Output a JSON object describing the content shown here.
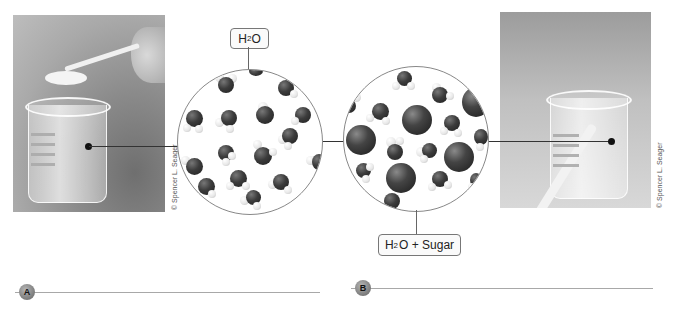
{
  "figure": {
    "panel_a": {
      "marker": "A",
      "photo": "Beaker of water with spoon of sugar being added",
      "photo_credit": "© Spencer L. Seager",
      "label": {
        "main": "H",
        "sub": "2",
        "tail": "O"
      }
    },
    "panel_b": {
      "marker": "B",
      "photo": "Beaker of sugar solution with stirring rod",
      "photo_credit": "© Spencer L. Seager",
      "label": {
        "main": "H",
        "sub": "2",
        "tail": "O + Sugar"
      }
    },
    "molecules": {
      "water_circle": "Water molecules (dark oxygen, white hydrogens)",
      "solution_circle": "Water molecules mixed with large dark sugar molecules"
    },
    "colors": {
      "oxygen": "#2e2e2e",
      "hydrogen": "#eeeeee",
      "sugar": "#333333",
      "marker": "#7a7a7a",
      "answer_line": "#a8a8a8"
    }
  }
}
